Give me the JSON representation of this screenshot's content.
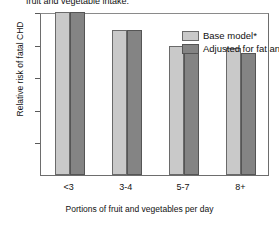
{
  "caption": "fruit and vegetable intake.",
  "chart_data": {
    "type": "bar",
    "title": "fruit and vegetable intake.",
    "xlabel": "Portions of fruit and vegetables per day",
    "ylabel": "Relative risk of fatal CHD",
    "categories": [
      "<3",
      "3-4",
      "5-7",
      "8+"
    ],
    "ylim": [
      0,
      1.0
    ],
    "ytick_labels": [
      "0",
      "0.2",
      "0.4",
      "0.6",
      "0.8",
      "1.0"
    ],
    "ytick_values": [
      0,
      0.2,
      0.4,
      0.6,
      0.8,
      1.0
    ],
    "grid": false,
    "legend_position": "top-right",
    "series": [
      {
        "name": "Base model*",
        "color": "#c9c9c9",
        "values": [
          1.0,
          0.89,
          0.79,
          0.78
        ]
      },
      {
        "name": "Adjusted for fat and fibre",
        "color": "#848484",
        "values": [
          1.0,
          0.89,
          0.77,
          0.75
        ]
      }
    ]
  }
}
